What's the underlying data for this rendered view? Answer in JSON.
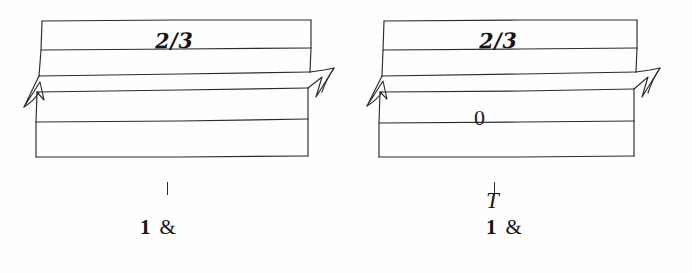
{
  "page": {
    "background_color": "#ffffff",
    "ink_color": "#1c1c1c",
    "width": 692,
    "height": 273
  },
  "figures": [
    {
      "id": "left-figure",
      "band_labels": [
        {
          "text": "2/3",
          "style": "handwritten"
        }
      ],
      "caption": {
        "tick": "|",
        "letter": "",
        "number": "1",
        "ampersand": "&"
      }
    },
    {
      "id": "right-figure",
      "band_labels": [
        {
          "text": "2/3",
          "style": "handwritten"
        },
        {
          "text": "0",
          "style": "printed"
        }
      ],
      "caption": {
        "tick": "|",
        "letter": "T",
        "number": "1",
        "ampersand": "&"
      }
    }
  ]
}
